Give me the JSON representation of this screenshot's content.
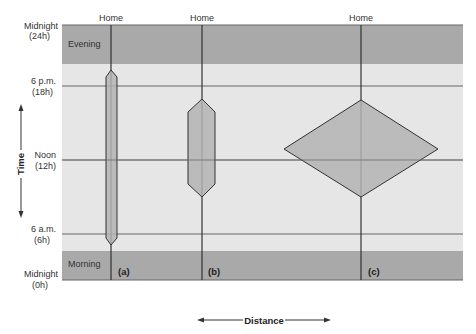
{
  "diagram": {
    "type": "time-geography space-time prism diagram",
    "bands": {
      "evening": {
        "label": "Evening",
        "color": "#a9a9a9"
      },
      "day": {
        "color": "#e6e6e6"
      },
      "morning": {
        "label": "Morning",
        "color": "#a9a9a9"
      }
    },
    "y_axis": {
      "title": "Time",
      "ticks": [
        {
          "label": "Midnight",
          "sub": "(24h)"
        },
        {
          "label": "6 p.m.",
          "sub": "(18h)"
        },
        {
          "label": "Noon",
          "sub": "(12h)"
        },
        {
          "label": "6 a.m.",
          "sub": "(6h)"
        },
        {
          "label": "Midnight",
          "sub": "(0h)"
        }
      ]
    },
    "x_axis": {
      "title": "Distance"
    },
    "paths": [
      {
        "id": "a",
        "top_label": "Home",
        "panel_label": "(a)",
        "shape": "narrow elongated hexagon",
        "start_time": "~5 a.m.",
        "end_time": "~7 p.m."
      },
      {
        "id": "b",
        "top_label": "Home",
        "panel_label": "(b)",
        "shape": "medium hexagon",
        "start_time": "~9 a.m.",
        "end_time": "~4 p.m."
      },
      {
        "id": "c",
        "top_label": "Home",
        "panel_label": "(c)",
        "shape": "wide diamond",
        "start_time": "~9 a.m.",
        "end_time": "~4 p.m."
      }
    ],
    "colors": {
      "prism_fill": "#b3b3b3",
      "line": "#333333",
      "gridline": "#666666"
    }
  }
}
